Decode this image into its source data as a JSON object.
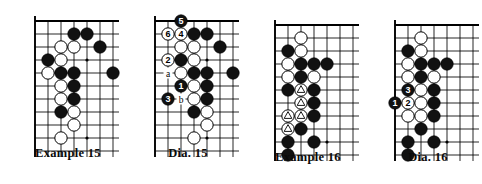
{
  "page": {
    "kind": "go-problem-diagrams",
    "background_color": "#ffffff",
    "line_color": "#000000",
    "black_stone_color": "#111111",
    "white_stone_color": "#ffffff"
  },
  "boards": [
    {
      "id": "example-15",
      "caption": "Example  15",
      "cols": 7,
      "rows": 11,
      "edges": {
        "left": true,
        "top": true,
        "right": false,
        "bottom": false
      },
      "star_points": [
        {
          "col": 4,
          "row": 3
        },
        {
          "col": 4,
          "row": 9
        }
      ],
      "stones": [
        {
          "col": 3,
          "row": 1,
          "color": "black"
        },
        {
          "col": 4,
          "row": 1,
          "color": "black"
        },
        {
          "col": 2,
          "row": 2,
          "color": "white"
        },
        {
          "col": 3,
          "row": 2,
          "color": "white"
        },
        {
          "col": 5,
          "row": 2,
          "color": "black"
        },
        {
          "col": 1,
          "row": 3,
          "color": "black"
        },
        {
          "col": 2,
          "row": 3,
          "color": "white"
        },
        {
          "col": 1,
          "row": 4,
          "color": "white"
        },
        {
          "col": 2,
          "row": 4,
          "color": "black"
        },
        {
          "col": 3,
          "row": 4,
          "color": "black"
        },
        {
          "col": 6,
          "row": 4,
          "color": "black"
        },
        {
          "col": 2,
          "row": 5,
          "color": "white"
        },
        {
          "col": 3,
          "row": 5,
          "color": "black"
        },
        {
          "col": 2,
          "row": 6,
          "color": "white"
        },
        {
          "col": 3,
          "row": 6,
          "color": "black"
        },
        {
          "col": 2,
          "row": 7,
          "color": "black"
        },
        {
          "col": 3,
          "row": 7,
          "color": "white"
        },
        {
          "col": 3,
          "row": 8,
          "color": "white"
        },
        {
          "col": 2,
          "row": 9,
          "color": "white"
        }
      ],
      "marks": [],
      "labels": []
    },
    {
      "id": "dia-15",
      "caption": "Dia. 15",
      "cols": 7,
      "rows": 11,
      "edges": {
        "left": true,
        "top": true,
        "right": false,
        "bottom": false
      },
      "star_points": [
        {
          "col": 4,
          "row": 3
        },
        {
          "col": 4,
          "row": 9
        }
      ],
      "stones": [
        {
          "col": 2,
          "row": 0,
          "color": "black",
          "number": "5"
        },
        {
          "col": 1,
          "row": 1,
          "color": "white",
          "number": "6"
        },
        {
          "col": 2,
          "row": 1,
          "color": "white",
          "number": "4"
        },
        {
          "col": 3,
          "row": 1,
          "color": "black"
        },
        {
          "col": 4,
          "row": 1,
          "color": "black"
        },
        {
          "col": 2,
          "row": 2,
          "color": "white"
        },
        {
          "col": 3,
          "row": 2,
          "color": "white"
        },
        {
          "col": 5,
          "row": 2,
          "color": "black"
        },
        {
          "col": 1,
          "row": 3,
          "color": "white",
          "number": "2"
        },
        {
          "col": 2,
          "row": 3,
          "color": "black"
        },
        {
          "col": 3,
          "row": 3,
          "color": "white"
        },
        {
          "col": 2,
          "row": 4,
          "color": "white"
        },
        {
          "col": 3,
          "row": 4,
          "color": "black"
        },
        {
          "col": 4,
          "row": 4,
          "color": "black"
        },
        {
          "col": 6,
          "row": 4,
          "color": "black"
        },
        {
          "col": 2,
          "row": 5,
          "color": "black",
          "number": "1"
        },
        {
          "col": 3,
          "row": 5,
          "color": "white"
        },
        {
          "col": 4,
          "row": 5,
          "color": "black"
        },
        {
          "col": 1,
          "row": 6,
          "color": "black",
          "number": "3"
        },
        {
          "col": 3,
          "row": 6,
          "color": "white"
        },
        {
          "col": 4,
          "row": 6,
          "color": "black"
        },
        {
          "col": 3,
          "row": 7,
          "color": "black"
        },
        {
          "col": 4,
          "row": 7,
          "color": "white"
        },
        {
          "col": 4,
          "row": 8,
          "color": "white"
        },
        {
          "col": 3,
          "row": 9,
          "color": "white"
        }
      ],
      "marks": [],
      "labels": [
        {
          "col": 1,
          "row": 4,
          "text": "a"
        },
        {
          "col": 2,
          "row": 6,
          "text": "b"
        }
      ]
    },
    {
      "id": "example-16",
      "caption": "Example  16",
      "cols": 7,
      "rows": 11,
      "edges": {
        "left": true,
        "top": true,
        "right": false,
        "bottom": false
      },
      "star_points": [
        {
          "col": 4,
          "row": 9
        }
      ],
      "stones": [
        {
          "col": 2,
          "row": 1,
          "color": "white"
        },
        {
          "col": 1,
          "row": 2,
          "color": "black"
        },
        {
          "col": 2,
          "row": 2,
          "color": "white"
        },
        {
          "col": 1,
          "row": 3,
          "color": "white"
        },
        {
          "col": 2,
          "row": 3,
          "color": "black"
        },
        {
          "col": 3,
          "row": 3,
          "color": "black"
        },
        {
          "col": 4,
          "row": 3,
          "color": "black"
        },
        {
          "col": 1,
          "row": 4,
          "color": "white"
        },
        {
          "col": 2,
          "row": 4,
          "color": "black"
        },
        {
          "col": 3,
          "row": 4,
          "color": "white"
        },
        {
          "col": 1,
          "row": 5,
          "color": "black"
        },
        {
          "col": 2,
          "row": 5,
          "color": "white",
          "mark": "triangle"
        },
        {
          "col": 3,
          "row": 5,
          "color": "black"
        },
        {
          "col": 2,
          "row": 6,
          "color": "white",
          "mark": "triangle"
        },
        {
          "col": 3,
          "row": 6,
          "color": "black"
        },
        {
          "col": 1,
          "row": 7,
          "color": "white",
          "mark": "triangle"
        },
        {
          "col": 2,
          "row": 7,
          "color": "white",
          "mark": "triangle"
        },
        {
          "col": 3,
          "row": 7,
          "color": "black"
        },
        {
          "col": 1,
          "row": 8,
          "color": "white",
          "mark": "triangle"
        },
        {
          "col": 2,
          "row": 8,
          "color": "black"
        },
        {
          "col": 1,
          "row": 9,
          "color": "black"
        },
        {
          "col": 3,
          "row": 9,
          "color": "black"
        },
        {
          "col": 1,
          "row": 10,
          "color": "black"
        }
      ],
      "marks": [],
      "labels": []
    },
    {
      "id": "dia-16",
      "caption": "Dia. 16",
      "cols": 7,
      "rows": 11,
      "edges": {
        "left": true,
        "top": true,
        "right": false,
        "bottom": false
      },
      "star_points": [
        {
          "col": 4,
          "row": 9
        }
      ],
      "stones": [
        {
          "col": 2,
          "row": 1,
          "color": "white"
        },
        {
          "col": 1,
          "row": 2,
          "color": "black"
        },
        {
          "col": 2,
          "row": 2,
          "color": "white"
        },
        {
          "col": 1,
          "row": 3,
          "color": "white"
        },
        {
          "col": 2,
          "row": 3,
          "color": "black"
        },
        {
          "col": 3,
          "row": 3,
          "color": "black"
        },
        {
          "col": 4,
          "row": 3,
          "color": "black"
        },
        {
          "col": 1,
          "row": 4,
          "color": "white"
        },
        {
          "col": 2,
          "row": 4,
          "color": "black"
        },
        {
          "col": 3,
          "row": 4,
          "color": "white"
        },
        {
          "col": 1,
          "row": 5,
          "color": "black",
          "number": "3"
        },
        {
          "col": 2,
          "row": 5,
          "color": "white"
        },
        {
          "col": 3,
          "row": 5,
          "color": "black"
        },
        {
          "col": 0,
          "row": 6,
          "color": "black",
          "number": "1"
        },
        {
          "col": 1,
          "row": 6,
          "color": "white",
          "number": "2"
        },
        {
          "col": 2,
          "row": 6,
          "color": "white"
        },
        {
          "col": 3,
          "row": 6,
          "color": "black"
        },
        {
          "col": 1,
          "row": 7,
          "color": "white"
        },
        {
          "col": 2,
          "row": 7,
          "color": "white"
        },
        {
          "col": 3,
          "row": 7,
          "color": "black"
        },
        {
          "col": 2,
          "row": 8,
          "color": "black"
        },
        {
          "col": 1,
          "row": 9,
          "color": "black"
        },
        {
          "col": 3,
          "row": 9,
          "color": "black"
        },
        {
          "col": 1,
          "row": 10,
          "color": "black"
        }
      ],
      "marks": [],
      "labels": []
    }
  ],
  "layout": {
    "cell": 13,
    "stone_radius": 6.2,
    "board_positions": [
      {
        "left": 28,
        "top": 14,
        "caption_top": 146,
        "caption_width": 110,
        "caption_left": -15
      },
      {
        "left": 148,
        "top": 14,
        "caption_top": 146,
        "caption_width": 110,
        "caption_left": -15
      },
      {
        "left": 268,
        "top": 18,
        "caption_top": 150,
        "caption_width": 110,
        "caption_left": -15
      },
      {
        "left": 388,
        "top": 18,
        "caption_top": 150,
        "caption_width": 110,
        "caption_left": -15
      }
    ]
  }
}
